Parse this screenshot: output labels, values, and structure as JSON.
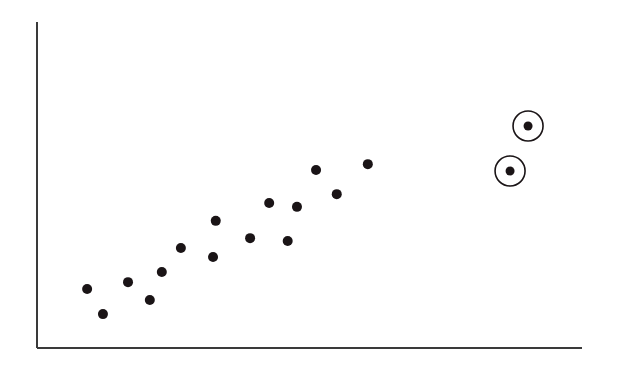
{
  "chart_data": {
    "type": "scatter",
    "title": "",
    "xlabel": "",
    "ylabel": "",
    "xlim": [
      0,
      100
    ],
    "ylim": [
      0,
      100
    ],
    "grid": false,
    "legend": null,
    "colors": {
      "axis": "#3a3a3a",
      "point": "#1a1416",
      "highlight_ring": "#1a1416",
      "background": "#ffffff"
    },
    "series": [
      {
        "name": "points",
        "points": [
          {
            "x": 9.2,
            "y": 18.1
          },
          {
            "x": 12.1,
            "y": 10.4
          },
          {
            "x": 16.7,
            "y": 20.2
          },
          {
            "x": 20.7,
            "y": 14.7
          },
          {
            "x": 22.9,
            "y": 23.3
          },
          {
            "x": 26.4,
            "y": 30.7
          },
          {
            "x": 32.3,
            "y": 27.9
          },
          {
            "x": 32.8,
            "y": 39.0
          },
          {
            "x": 39.1,
            "y": 33.7
          },
          {
            "x": 42.6,
            "y": 44.5
          },
          {
            "x": 46.0,
            "y": 32.8
          },
          {
            "x": 47.7,
            "y": 43.3
          },
          {
            "x": 51.2,
            "y": 54.6
          },
          {
            "x": 55.0,
            "y": 47.2
          },
          {
            "x": 60.7,
            "y": 56.4
          }
        ]
      },
      {
        "name": "highlighted outliers",
        "circled": true,
        "points": [
          {
            "x": 86.8,
            "y": 54.3
          },
          {
            "x": 90.1,
            "y": 68.1
          }
        ]
      }
    ],
    "annotations": [
      "Two outlier points at upper right are circled"
    ]
  }
}
